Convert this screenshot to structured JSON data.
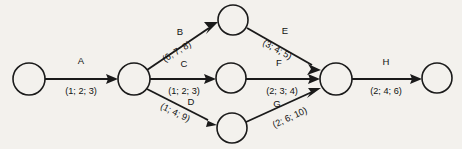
{
  "diagram": {
    "type": "activity-on-arrow-network",
    "background_color": "#f3f1ed",
    "line_color": "#1a1a1a",
    "nodes": [
      {
        "id": "n1",
        "label": "",
        "cx": 29,
        "cy": 79,
        "r": 16
      },
      {
        "id": "n2",
        "label": "",
        "cx": 134,
        "cy": 79,
        "r": 16
      },
      {
        "id": "n3",
        "label": "",
        "cx": 233,
        "cy": 20,
        "r": 15
      },
      {
        "id": "n4",
        "label": "",
        "cx": 231,
        "cy": 78,
        "r": 15
      },
      {
        "id": "n5",
        "label": "",
        "cx": 232,
        "cy": 128,
        "r": 15
      },
      {
        "id": "n6",
        "label": "",
        "cx": 336,
        "cy": 79,
        "r": 16
      },
      {
        "id": "n7",
        "label": "",
        "cx": 437,
        "cy": 78,
        "r": 15
      }
    ],
    "edges": [
      {
        "id": "edge-a",
        "activity": "A",
        "estimate": "(1; 2; 3)",
        "from": "n1",
        "to": "n2",
        "activity_x": 81,
        "activity_y": 61,
        "estimate_x": 81,
        "estimate_y": 92,
        "rotation": 0
      },
      {
        "id": "edge-b",
        "activity": "B",
        "estimate": "(6; 7; 8)",
        "from": "n2",
        "to": "n3",
        "activity_x": 180,
        "activity_y": 32,
        "estimate_x": 177,
        "estimate_y": 52,
        "rotation": -31
      },
      {
        "id": "edge-c",
        "activity": "C",
        "estimate": "(1; 2; 3)",
        "from": "n2",
        "to": "n4",
        "activity_x": 184,
        "activity_y": 64,
        "estimate_x": 184,
        "estimate_y": 92,
        "rotation": 0
      },
      {
        "id": "edge-d",
        "activity": "D",
        "estimate": "(1; 4; 9)",
        "from": "n2",
        "to": "n5",
        "activity_x": 191,
        "activity_y": 102,
        "estimate_x": 175,
        "estimate_y": 113,
        "rotation": 26
      },
      {
        "id": "edge-e",
        "activity": "E",
        "estimate": "(3; 4; 5)",
        "from": "n3",
        "to": "n6",
        "activity_x": 285,
        "activity_y": 31,
        "estimate_x": 277,
        "estimate_y": 50,
        "rotation": 29
      },
      {
        "id": "edge-f",
        "activity": "F",
        "estimate": "(2; 3; 4)",
        "from": "n4",
        "to": "n6",
        "activity_x": 279,
        "activity_y": 63,
        "estimate_x": 282,
        "estimate_y": 92,
        "rotation": 0
      },
      {
        "id": "edge-g",
        "activity": "G",
        "estimate": "(2; 6; 10)",
        "from": "n5",
        "to": "n6",
        "activity_x": 277,
        "activity_y": 104,
        "estimate_x": 290,
        "estimate_y": 118,
        "rotation": -25
      },
      {
        "id": "edge-h",
        "activity": "H",
        "estimate": "(2; 4; 6)",
        "from": "n6",
        "to": "n7",
        "activity_x": 386,
        "activity_y": 62,
        "estimate_x": 386,
        "estimate_y": 92,
        "rotation": 0
      }
    ]
  }
}
